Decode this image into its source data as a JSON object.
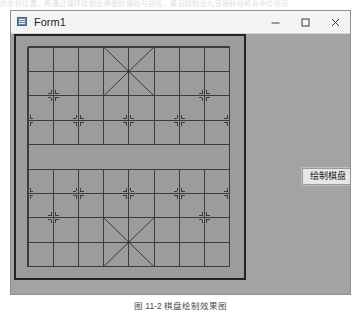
{
  "page": {
    "top_cut_text": "的坐标位置，再通过循环绘制出棋盘的横线与竖线，最后绘制出九宫格斜线和兵卒位标记",
    "figure_caption": "图 11-2  棋盘绘制效果图"
  },
  "window": {
    "title": "Form1",
    "icon": "app-window-icon",
    "controls": [
      {
        "name": "minimize",
        "glyph": "minimize-icon"
      },
      {
        "name": "maximize",
        "glyph": "maximize-icon"
      },
      {
        "name": "close",
        "glyph": "close-icon"
      }
    ],
    "background_color": "#a3a3a3",
    "titlebar_color": "#f4f4f4"
  },
  "controls": {
    "draw_board_button": "绘制棋盘"
  },
  "board": {
    "name": "xiangqi-board",
    "columns": 9,
    "rows": 10,
    "line_color": "#3c3c3c",
    "board_color": "#9c9c9c",
    "border_color": "#232323",
    "river_rows": [
      4,
      5
    ],
    "palace_top": {
      "cols": [
        3,
        5
      ],
      "rows": [
        0,
        2
      ]
    },
    "palace_bottom": {
      "cols": [
        3,
        5
      ],
      "rows": [
        7,
        9
      ]
    },
    "position_markers": [
      {
        "col": 0,
        "row": 3
      },
      {
        "col": 2,
        "row": 3
      },
      {
        "col": 4,
        "row": 3
      },
      {
        "col": 6,
        "row": 3
      },
      {
        "col": 8,
        "row": 3
      },
      {
        "col": 0,
        "row": 6
      },
      {
        "col": 2,
        "row": 6
      },
      {
        "col": 4,
        "row": 6
      },
      {
        "col": 6,
        "row": 6
      },
      {
        "col": 8,
        "row": 6
      }
    ],
    "cannon_markers": [
      {
        "col": 1,
        "row": 2
      },
      {
        "col": 7,
        "row": 2
      },
      {
        "col": 1,
        "row": 7
      },
      {
        "col": 7,
        "row": 7
      }
    ]
  }
}
